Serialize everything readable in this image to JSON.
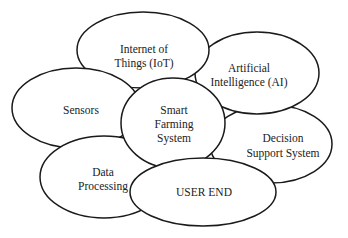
{
  "diagram": {
    "title": "Smart Farming System",
    "style": {
      "stroke": "#1a1a1a",
      "fill": "#ffffff",
      "text": "#222222"
    },
    "nodes": [
      {
        "id": "decision",
        "lines": [
          "Decision",
          "Support System"
        ],
        "cx": 271,
        "cy": 144,
        "rx": 61,
        "ry": 39
      },
      {
        "id": "ai",
        "lines": [
          "Artificial",
          "Intelligence (AI)"
        ],
        "cx": 257,
        "cy": 73,
        "rx": 62,
        "ry": 41
      },
      {
        "id": "iot",
        "lines": [
          "Internet of",
          "Things (IoT)"
        ],
        "cx": 143,
        "cy": 50,
        "rx": 66,
        "ry": 38
      },
      {
        "id": "sensors",
        "lines": [
          "Sensors"
        ],
        "cx": 76,
        "cy": 108,
        "rx": 64,
        "ry": 40
      },
      {
        "id": "data",
        "lines": [
          "Data",
          "Processing"
        ],
        "cx": 104,
        "cy": 177,
        "rx": 64,
        "ry": 41
      },
      {
        "id": "center",
        "lines": [
          "Smart",
          "Farming",
          "System"
        ],
        "cx": 173,
        "cy": 123,
        "rx": 52,
        "ry": 45
      },
      {
        "id": "user",
        "lines": [
          "USER END"
        ],
        "cx": 203,
        "cy": 192,
        "rx": 73,
        "ry": 34
      }
    ]
  }
}
